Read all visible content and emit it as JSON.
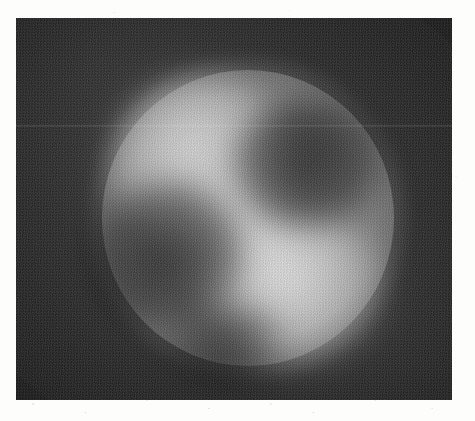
{
  "document": {
    "type": "scanned-figure",
    "media": "grayscale-micrograph",
    "alt_text": "Grayscale micrograph of a bright circular particle on a dark noisy background, with two darker internal lobes forming a pinwheel pattern"
  },
  "canvas": {
    "width": 475,
    "height": 421,
    "paper_color": "#fdfdfc"
  },
  "micrograph": {
    "frame": {
      "left": 16,
      "top": 18,
      "width": 436,
      "height": 382
    },
    "background_color": "#2b2b2b",
    "background_color_light": "#343434",
    "noise": "film-grain"
  },
  "chart_data": {
    "type": "heatmap",
    "title": "",
    "xlabel": "",
    "ylabel": "",
    "colormap": "grayscale",
    "value_range": [
      0,
      255
    ],
    "features": [
      {
        "name": "particle-disc",
        "shape": "ellipse",
        "center": [
          242,
          218
        ],
        "radius_x": 146,
        "radius_y": 148,
        "mean_intensity": 150,
        "color": "#969696"
      },
      {
        "name": "bright-lobe-upper-left",
        "shape": "ellipse",
        "center": [
          200,
          161
        ],
        "radius_x": 88,
        "radius_y": 85,
        "mean_intensity": 186,
        "color": "#bababa"
      },
      {
        "name": "bright-lobe-lower-right",
        "shape": "ellipse",
        "center": [
          293,
          289
        ],
        "radius_x": 91,
        "radius_y": 75,
        "mean_intensity": 190,
        "color": "#bebebe"
      },
      {
        "name": "dark-lobe-upper-right",
        "shape": "ellipse",
        "center": [
          307,
          164
        ],
        "radius_x": 73,
        "radius_y": 64,
        "mean_intensity": 84,
        "color": "#545454"
      },
      {
        "name": "dark-lobe-lower-left",
        "shape": "ellipse",
        "center": [
          166,
          255
        ],
        "radius_x": 78,
        "radius_y": 73,
        "mean_intensity": 90,
        "color": "#5a5a5a"
      },
      {
        "name": "background-field",
        "shape": "rect",
        "center": [
          234,
          209
        ],
        "mean_intensity": 43,
        "color": "#2b2b2b"
      }
    ]
  }
}
